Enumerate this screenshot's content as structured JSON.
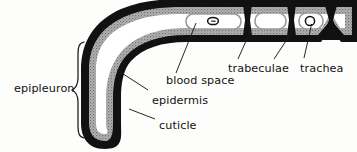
{
  "figure": {
    "background_color": "#fdfdfc",
    "ink_color": "#111111",
    "epidermis_color": "#9a9a9a",
    "blood_space_color": "#ffffff",
    "leader_color": "#1a1a1a"
  },
  "labels": {
    "epipleuron": "epipleuron",
    "blood_space": "blood space",
    "epidermis": "epidermis",
    "cuticle": "cuticle",
    "trabeculae": "trabeculae",
    "trachea": "trachea"
  },
  "structures": {
    "cuticle": {
      "name": "cuticle",
      "description": "outer black sclerotized layer forming the hook-shaped wall",
      "fill": "#111111"
    },
    "epidermis": {
      "name": "epidermis",
      "description": "stippled grey cell layer lining the inside of the cuticle",
      "fill": "#9a9a9a"
    },
    "blood_space": {
      "name": "blood space",
      "description": "white haemolymph lumen between epidermal layers",
      "fill": "#ffffff"
    },
    "trabeculae": {
      "name": "trabeculae",
      "count": 3,
      "description": "dark cuticular pillars dividing the blood space into chambers"
    },
    "trachea": {
      "name": "trachea",
      "count": 2,
      "description": "small circular tracheal tubes within the blood space"
    },
    "brace": {
      "name": "epipleuron-brace",
      "description": "curly brace spanning the vertical limb of the epipleuron"
    }
  }
}
